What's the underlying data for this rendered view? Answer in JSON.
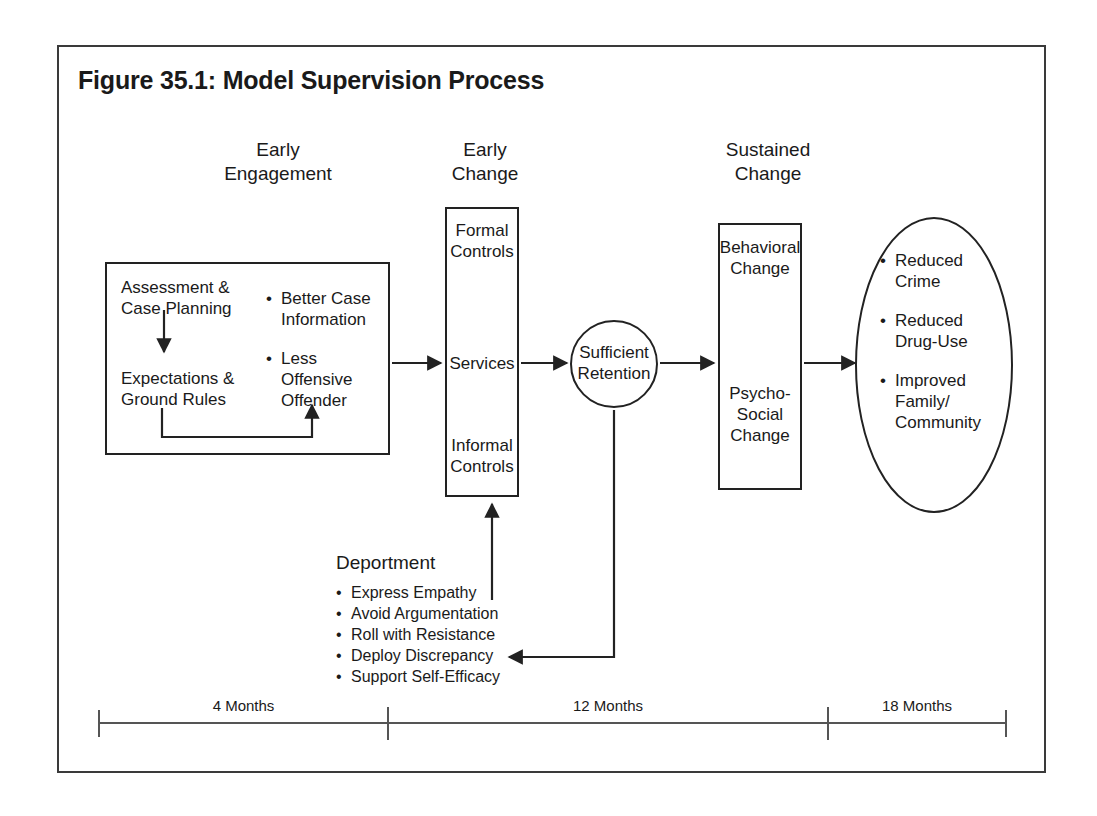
{
  "figure": {
    "title": "Figure 35.1: Model Supervision Process",
    "border_color": "#3a3a3a",
    "line_color": "#222222",
    "background": "#ffffff"
  },
  "phases": [
    {
      "id": "early-engagement",
      "label": "Early\nEngagement"
    },
    {
      "id": "early-change",
      "label": "Early\nChange"
    },
    {
      "id": "sustained-change",
      "label": "Sustained\nChange"
    }
  ],
  "early_engagement_box": {
    "step_1": "Assessment &\nCase Planning",
    "step_2": "Expectations &\nGround Rules",
    "outcomes": [
      "Better Case\nInformation",
      "Less Offensive\nOffender"
    ]
  },
  "early_change_box": {
    "items": [
      "Formal\nControls",
      "Services",
      "Informal\nControls"
    ]
  },
  "retention_circle": {
    "label": "Sufficient\nRetention"
  },
  "sustained_change_box": {
    "items": [
      "Behavioral\nChange",
      "Psycho-\nSocial\nChange"
    ]
  },
  "outcomes_ellipse": {
    "items": [
      "Reduced\nCrime",
      "Reduced\nDrug-Use",
      "Improved\nFamily/\nCommunity"
    ]
  },
  "deportment": {
    "title": "Deportment",
    "items": [
      "Express Empathy",
      "Avoid Argumentation",
      "Roll with Resistance",
      "Deploy Discrepancy",
      "Support Self-Efficacy"
    ]
  },
  "timeline": {
    "segments": [
      {
        "label": "4 Months"
      },
      {
        "label": "12 Months"
      },
      {
        "label": "18 Months"
      }
    ]
  }
}
